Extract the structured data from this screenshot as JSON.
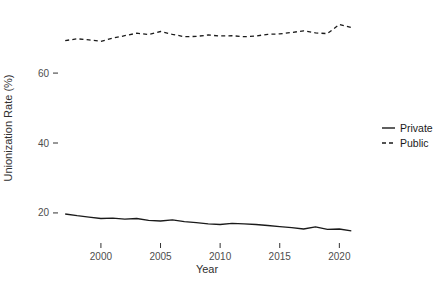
{
  "chart_data": {
    "type": "line",
    "title": "",
    "xlabel": "Year",
    "ylabel": "Unionization Rate (%)",
    "x": [
      1997,
      1998,
      1999,
      2000,
      2001,
      2002,
      2003,
      2004,
      2005,
      2006,
      2007,
      2008,
      2009,
      2010,
      2011,
      2012,
      2013,
      2014,
      2015,
      2016,
      2017,
      2018,
      2019,
      2020,
      2021
    ],
    "series": [
      {
        "name": "Private",
        "style": "solid",
        "values": [
          19.7,
          19.2,
          18.8,
          18.4,
          18.5,
          18.2,
          18.4,
          17.9,
          17.7,
          18.0,
          17.5,
          17.2,
          16.9,
          16.7,
          17.0,
          16.9,
          16.7,
          16.4,
          16.1,
          15.8,
          15.4,
          16.0,
          15.3,
          15.4,
          14.9
        ]
      },
      {
        "name": "Public",
        "style": "dashed",
        "values": [
          69.3,
          69.8,
          69.5,
          69.1,
          70.0,
          70.7,
          71.4,
          71.0,
          71.9,
          71.1,
          70.4,
          70.5,
          70.9,
          70.6,
          70.7,
          70.4,
          70.6,
          71.1,
          71.2,
          71.6,
          72.1,
          71.5,
          71.3,
          73.9,
          73.0
        ]
      }
    ],
    "x_ticks": [
      2000,
      2005,
      2010,
      2015,
      2020
    ],
    "y_ticks": [
      20,
      40,
      60
    ],
    "xlim": [
      1996.4,
      2021.9
    ],
    "ylim": [
      11.4,
      76.9
    ],
    "grid": false,
    "legend_position": "right",
    "line_color": "#1a1a1a",
    "tick_color": "#333333",
    "tick_label_color": "#4d4d4d",
    "background_color": "#ffffff"
  }
}
